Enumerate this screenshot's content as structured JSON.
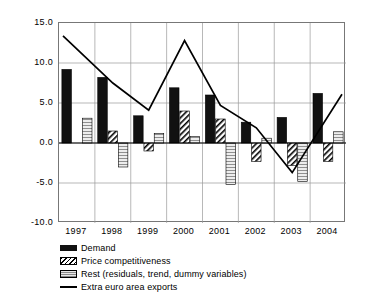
{
  "chart_data": {
    "type": "bar",
    "title": "",
    "subtitle": "",
    "xlabel": "",
    "ylabel": "",
    "categories": [
      "1997",
      "1998",
      "1999",
      "2000",
      "2001",
      "2002",
      "2003",
      "2004"
    ],
    "ylim": [
      -10.0,
      15.0
    ],
    "ytick_labels": [
      "15.0",
      "10.0",
      "5.0",
      "0.0",
      "-5.0",
      "-10.0"
    ],
    "ytick_values": [
      15.0,
      10.0,
      5.0,
      0.0,
      -5.0,
      -10.0
    ],
    "grid": true,
    "grid_axis": "both",
    "legend_position": "bottom-left",
    "series": [
      {
        "name": "Demand",
        "type": "bar",
        "style": "solid-black",
        "color": "#111111",
        "values": [
          9.2,
          8.2,
          3.4,
          6.9,
          6.0,
          2.6,
          3.2,
          6.2
        ]
      },
      {
        "name": "Price competitiveness",
        "type": "bar",
        "style": "diagonal-hatch",
        "color": "#000000",
        "values": [
          0.0,
          1.5,
          -1.0,
          4.0,
          3.0,
          -2.3,
          -2.8,
          -2.3
        ]
      },
      {
        "name": "Rest (residuals, trend, dummy variables)",
        "type": "bar",
        "style": "horizontal-hatch-grey",
        "color": "#8a8a8a",
        "values": [
          3.1,
          -3.0,
          1.2,
          0.8,
          -5.2,
          0.6,
          -4.8,
          1.4
        ]
      },
      {
        "name": "Extra euro area exports",
        "type": "line",
        "style": "solid-line",
        "color": "#000000",
        "values": [
          13.4,
          7.5,
          4.1,
          12.8,
          4.7,
          1.9,
          -3.7,
          6.1
        ]
      }
    ]
  },
  "legend": {
    "items": [
      {
        "label": "Demand",
        "swatch": "solid-black-bar-swatch"
      },
      {
        "label": "Price competitiveness",
        "swatch": "hatched-bar-swatch"
      },
      {
        "label": "Rest (residuals, trend, dummy variables)",
        "swatch": "grey-bar-swatch"
      },
      {
        "label": "Extra euro area exports",
        "swatch": "line-swatch"
      }
    ]
  }
}
